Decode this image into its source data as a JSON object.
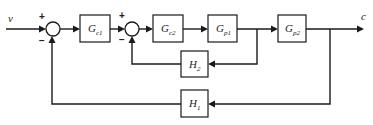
{
  "diagram": {
    "type": "cascade-control-block-diagram",
    "input": {
      "label": "v"
    },
    "output": {
      "label": "c"
    },
    "summers": [
      {
        "id": "sum1",
        "plus_sign": "+",
        "minus_sign": "−"
      },
      {
        "id": "sum2",
        "plus_sign": "+",
        "minus_sign": "−"
      }
    ],
    "blocks": {
      "gc1": {
        "main": "G",
        "sub": "c1"
      },
      "gc2": {
        "main": "G",
        "sub": "c2"
      },
      "gp1": {
        "main": "G",
        "sub": "p1"
      },
      "gp2": {
        "main": "G",
        "sub": "p2"
      },
      "h2": {
        "main": "H",
        "sub": "2"
      },
      "h1": {
        "main": "H",
        "sub": "1"
      }
    },
    "colors": {
      "stroke": "#1a1a1a",
      "background": "#ffffff"
    }
  }
}
